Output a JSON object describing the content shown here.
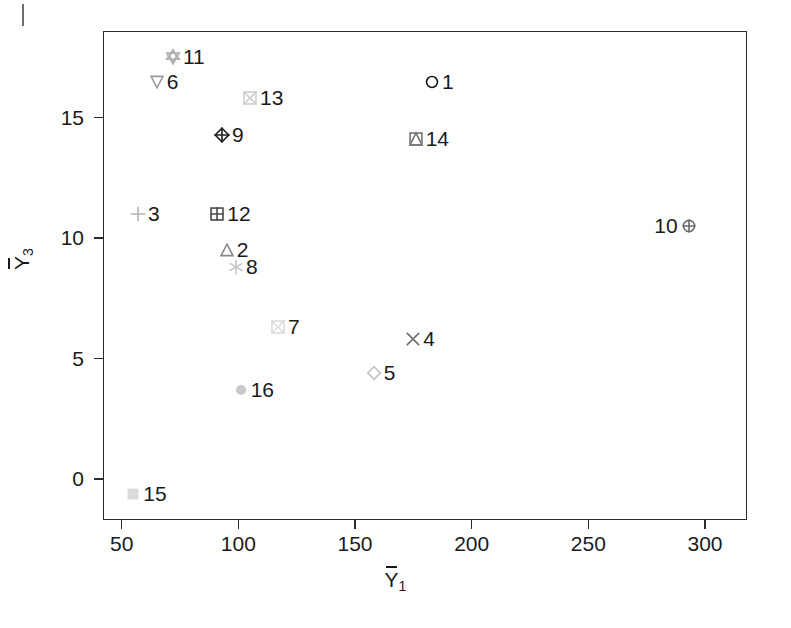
{
  "chart_data": {
    "type": "scatter",
    "title": "",
    "xlabel": "Y̅1",
    "ylabel": "Y̅3",
    "xlabel_base": "Y",
    "xlabel_sub": "1",
    "ylabel_base": "Y",
    "ylabel_sub": "3",
    "xlim": [
      42,
      318
    ],
    "ylim": [
      -1.7,
      18.6
    ],
    "xticks": [
      50,
      100,
      150,
      200,
      250,
      300
    ],
    "yticks": [
      0,
      5,
      10,
      15
    ],
    "xtick_labels": [
      "50",
      "100",
      "150",
      "200",
      "250",
      "300"
    ],
    "ytick_labels": [
      "0",
      "5",
      "10",
      "15"
    ],
    "grid": false,
    "legend": "none",
    "point_label_field": "label",
    "points": [
      {
        "label": "1",
        "x": 183,
        "y": 16.5,
        "marker": "circle-open",
        "color": "#1a1a1a",
        "label_side": "right"
      },
      {
        "label": "2",
        "x": 95,
        "y": 9.5,
        "marker": "triangle-up-open",
        "color": "#8a8a8a",
        "label_side": "right"
      },
      {
        "label": "3",
        "x": 57,
        "y": 11.0,
        "marker": "plus",
        "color": "#b5b5b5",
        "label_side": "right"
      },
      {
        "label": "4",
        "x": 175,
        "y": 5.8,
        "marker": "cross-x",
        "color": "#6e6e6e",
        "label_side": "right"
      },
      {
        "label": "5",
        "x": 158,
        "y": 4.4,
        "marker": "diamond-open",
        "color": "#c2c2c2",
        "label_side": "right"
      },
      {
        "label": "6",
        "x": 65,
        "y": 16.5,
        "marker": "triangle-down-open",
        "color": "#9b9b9b",
        "label_side": "right"
      },
      {
        "label": "7",
        "x": 117,
        "y": 6.3,
        "marker": "square-x",
        "color": "#dcdcdc",
        "label_side": "right"
      },
      {
        "label": "8",
        "x": 99,
        "y": 8.8,
        "marker": "asterisk",
        "color": "#c8c8c8",
        "label_side": "right"
      },
      {
        "label": "9",
        "x": 93,
        "y": 14.3,
        "marker": "diamond-plus",
        "color": "#1f1f1f",
        "label_side": "right"
      },
      {
        "label": "10",
        "x": 293,
        "y": 10.5,
        "marker": "circle-plus",
        "color": "#6a6a6a",
        "label_side": "left"
      },
      {
        "label": "11",
        "x": 72,
        "y": 17.5,
        "marker": "star-square",
        "color": "#b0b0b0",
        "label_side": "right"
      },
      {
        "label": "12",
        "x": 91,
        "y": 11.0,
        "marker": "square-plus",
        "color": "#4a4a4a",
        "label_side": "right"
      },
      {
        "label": "13",
        "x": 105,
        "y": 15.8,
        "marker": "square-x",
        "color": "#cfcfcf",
        "label_side": "right"
      },
      {
        "label": "14",
        "x": 176,
        "y": 14.1,
        "marker": "square-triangle",
        "color": "#777777",
        "label_side": "right"
      },
      {
        "label": "15",
        "x": 55,
        "y": -0.6,
        "marker": "square-filled",
        "color": "#dadada",
        "label_side": "right"
      },
      {
        "label": "16",
        "x": 101,
        "y": 3.7,
        "marker": "circle-filled",
        "color": "#c9c9c9",
        "label_side": "right"
      }
    ]
  },
  "axes": {
    "frame_color": "#2b2b2b",
    "tick_color": "#2b2b2b",
    "text_color": "#1a1a1a"
  }
}
